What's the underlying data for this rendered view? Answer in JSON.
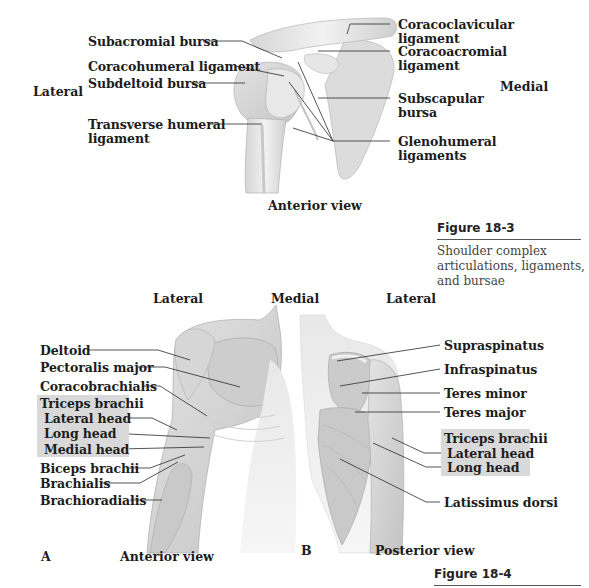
{
  "figure_18_3": {
    "directions": {
      "left": "Lateral",
      "right": "Medial"
    },
    "labels_left": [
      "Subacromial bursa",
      "Coracohumeral ligament",
      "Subdeltoid bursa",
      "Transverse humeral",
      "ligament"
    ],
    "labels_right": [
      "Coracoclavicular",
      "ligament",
      "Coracoacromial",
      "ligament",
      "Subscapular",
      "bursa",
      "Glenohumeral",
      "ligaments"
    ],
    "view": "Anterior view",
    "title": "Figure 18-3",
    "caption": [
      "Shoulder complex",
      "articulations, ligaments,",
      "and bursae"
    ]
  },
  "figure_18_4": {
    "directions": {
      "left": "Lateral",
      "center": "Medial",
      "right": "Lateral"
    },
    "panel_a": {
      "letter": "A",
      "view": "Anterior view",
      "labels": [
        "Deltoid",
        "Pectoralis major",
        "Coracobrachialis",
        "Biceps brachii",
        "Brachialis",
        "Brachioradialis"
      ],
      "triceps_group": {
        "title": "Triceps brachii",
        "heads": [
          "Lateral head",
          "Long head",
          "Medial head"
        ]
      }
    },
    "panel_b": {
      "letter": "B",
      "view": "Posterior view",
      "labels": [
        "Supraspinatus",
        "Infraspinatus",
        "Teres minor",
        "Teres major",
        "Latissimus dorsi"
      ],
      "triceps_group": {
        "title": "Triceps brachii",
        "heads": [
          "Lateral head",
          "Long head"
        ]
      }
    },
    "title": "Figure 18-4"
  },
  "colors": {
    "highlight_box": "#d9d9d9",
    "leader_line": "#2a2a2a",
    "illustration_light": "#eaeaea",
    "illustration_mid": "#cfcfcf",
    "illustration_dark": "#a9a9a9"
  }
}
